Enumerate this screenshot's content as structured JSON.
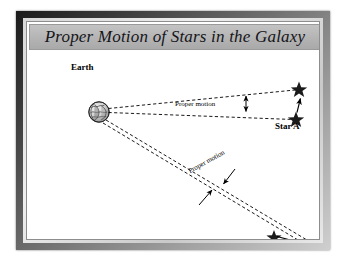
{
  "figure": {
    "title": "Proper Motion of Stars in the Galaxy",
    "kind": "astronomy-diagram",
    "frame_color": "#3a3a3a",
    "banner_color": "#b4b4b4",
    "background_color": "#ffffff",
    "ink_color": "#000000"
  },
  "labels": {
    "earth": "Earth",
    "star_a": "Star A",
    "star_b": "Star B",
    "proper_motion_top": "Proper motion",
    "proper_motion_bottom": "Proper motion"
  },
  "diagram_data": {
    "type": "schematic",
    "observer": {
      "name": "Earth",
      "x": 72,
      "y": 62,
      "radius": 10
    },
    "objects": [
      {
        "name": "Star A",
        "position_start": {
          "x": 270,
          "y": 68
        },
        "position_end": {
          "x": 274,
          "y": 38
        },
        "motion_direction": "up"
      },
      {
        "name": "Star B",
        "position_start": {
          "x": 247,
          "y": 186
        },
        "position_end": {
          "x": 293,
          "y": 198
        },
        "motion_direction": "down-right"
      }
    ],
    "sight_lines": [
      {
        "from": "Earth",
        "to": "Star A start",
        "style": "dashed"
      },
      {
        "from": "Earth",
        "to": "Star A end",
        "style": "dashed"
      },
      {
        "from": "Earth",
        "to": "Star B start",
        "style": "dashed"
      },
      {
        "from": "Earth",
        "to": "Star B end",
        "style": "dashed"
      }
    ],
    "annotations": [
      {
        "label": "Proper motion",
        "marker": "double-headed-arrow",
        "orientation": "vertical",
        "target": "angle between Star A sight lines"
      },
      {
        "label": "Proper motion",
        "marker": "two-converging-arrows",
        "orientation": "diagonal",
        "target": "angle between Star B sight lines"
      }
    ]
  }
}
